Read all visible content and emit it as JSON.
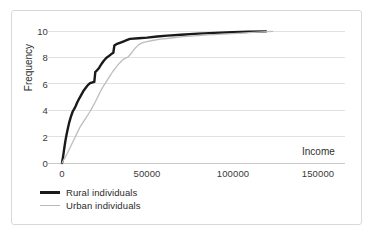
{
  "chart_data": {
    "type": "line",
    "title": "",
    "xlabel": "Income",
    "ylabel": "Frequency",
    "xlim": [
      0,
      170000
    ],
    "ylim": [
      0,
      10.4
    ],
    "xticks": [
      "0",
      "50000",
      "100000",
      "150000"
    ],
    "xtick_values": [
      0,
      50000,
      100000,
      150000
    ],
    "yticks": [
      "0",
      "2",
      "4",
      "6",
      "8",
      "10"
    ],
    "ytick_values": [
      0,
      2,
      4,
      6,
      8,
      10
    ],
    "grid": "horizontal",
    "legend_position": "below-plot",
    "series": [
      {
        "name": "Rural individuals",
        "color": "#1a1a1a",
        "width": 2.4,
        "points": [
          [
            0,
            0.0
          ],
          [
            600,
            0.45
          ],
          [
            1200,
            1.0
          ],
          [
            1900,
            1.6
          ],
          [
            2600,
            2.1
          ],
          [
            3400,
            2.6
          ],
          [
            4300,
            3.1
          ],
          [
            5200,
            3.5
          ],
          [
            6300,
            3.9
          ],
          [
            7200,
            4.1
          ],
          [
            8000,
            4.3
          ],
          [
            9000,
            4.6
          ],
          [
            10200,
            4.9
          ],
          [
            11500,
            5.2
          ],
          [
            12800,
            5.5
          ],
          [
            14000,
            5.7
          ],
          [
            15200,
            5.9
          ],
          [
            16500,
            6.05
          ],
          [
            17800,
            6.1
          ],
          [
            19000,
            6.15
          ],
          [
            19600,
            6.9
          ],
          [
            20500,
            7.0
          ],
          [
            21800,
            7.2
          ],
          [
            23200,
            7.5
          ],
          [
            24600,
            7.75
          ],
          [
            26000,
            7.95
          ],
          [
            27500,
            8.1
          ],
          [
            29000,
            8.25
          ],
          [
            30200,
            8.35
          ],
          [
            30800,
            8.9
          ],
          [
            32000,
            9.0
          ],
          [
            34000,
            9.1
          ],
          [
            36000,
            9.2
          ],
          [
            38000,
            9.3
          ],
          [
            40000,
            9.4
          ],
          [
            45000,
            9.45
          ],
          [
            50000,
            9.5
          ],
          [
            56000,
            9.58
          ],
          [
            62000,
            9.65
          ],
          [
            70000,
            9.72
          ],
          [
            80000,
            9.8
          ],
          [
            90000,
            9.86
          ],
          [
            100000,
            9.9
          ],
          [
            110000,
            9.94
          ],
          [
            120000,
            9.97
          ]
        ]
      },
      {
        "name": "Urban individuals",
        "color": "#bdbdbd",
        "width": 1.3,
        "points": [
          [
            0,
            0.0
          ],
          [
            1500,
            0.35
          ],
          [
            3000,
            0.7
          ],
          [
            4500,
            1.1
          ],
          [
            6000,
            1.5
          ],
          [
            7500,
            1.9
          ],
          [
            9000,
            2.3
          ],
          [
            10500,
            2.7
          ],
          [
            12000,
            3.0
          ],
          [
            13500,
            3.3
          ],
          [
            15000,
            3.6
          ],
          [
            16500,
            3.9
          ],
          [
            18000,
            4.25
          ],
          [
            19500,
            4.6
          ],
          [
            21000,
            5.0
          ],
          [
            22500,
            5.4
          ],
          [
            24000,
            5.75
          ],
          [
            25500,
            6.05
          ],
          [
            27000,
            6.35
          ],
          [
            28500,
            6.65
          ],
          [
            30000,
            6.95
          ],
          [
            31500,
            7.2
          ],
          [
            33000,
            7.45
          ],
          [
            34500,
            7.65
          ],
          [
            36000,
            7.85
          ],
          [
            37500,
            7.95
          ],
          [
            39000,
            8.05
          ],
          [
            41000,
            8.35
          ],
          [
            43000,
            8.7
          ],
          [
            45000,
            8.95
          ],
          [
            47000,
            9.1
          ],
          [
            50000,
            9.2
          ],
          [
            54000,
            9.3
          ],
          [
            58000,
            9.38
          ],
          [
            63000,
            9.45
          ],
          [
            70000,
            9.55
          ],
          [
            78000,
            9.63
          ],
          [
            86000,
            9.7
          ],
          [
            95000,
            9.76
          ],
          [
            103000,
            9.82
          ],
          [
            110000,
            9.88
          ],
          [
            118000,
            9.93
          ],
          [
            124000,
            9.97
          ]
        ]
      }
    ]
  },
  "legend": {
    "items": [
      {
        "label": "Rural individuals"
      },
      {
        "label": "Urban individuals"
      }
    ]
  }
}
